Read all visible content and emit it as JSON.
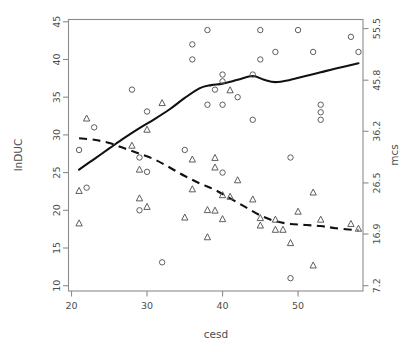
{
  "figure": {
    "width": 409,
    "height": 352,
    "background": "#ffffff",
    "foreground": "#4d4d4d"
  },
  "chart_data": {
    "type": "scatter",
    "title": "",
    "subtitle": "",
    "xlabel": "cesd",
    "ylabel": "lnDUC",
    "y2label": "mcs",
    "grid": false,
    "legend": "none",
    "xlim": [
      19.6,
      58.6
    ],
    "ylim": [
      9.3,
      45.3
    ],
    "y2lim": [
      6.2,
      57.2
    ],
    "xticks": [
      20,
      30,
      40,
      50
    ],
    "yticks": [
      10,
      15,
      20,
      25,
      30,
      35,
      40,
      45
    ],
    "y2ticks": [
      7.2,
      16.9,
      26.5,
      36.2,
      45.8,
      55.5
    ],
    "series": [
      {
        "name": "lnDUC",
        "marker": "circle",
        "axis": "left",
        "points": [
          [
            21,
            28.0
          ],
          [
            22,
            23.0
          ],
          [
            23,
            31.0
          ],
          [
            28,
            36.0
          ],
          [
            29,
            27.0
          ],
          [
            29,
            20.0
          ],
          [
            30,
            33.1
          ],
          [
            30,
            25.1
          ],
          [
            32,
            13.1
          ],
          [
            35,
            28.0
          ],
          [
            36,
            42.0
          ],
          [
            36,
            40.0
          ],
          [
            38,
            43.9
          ],
          [
            38,
            34.0
          ],
          [
            39,
            36.0
          ],
          [
            40,
            38.0
          ],
          [
            40,
            37.1
          ],
          [
            40,
            34.0
          ],
          [
            40,
            25.0
          ],
          [
            42,
            35.0
          ],
          [
            44,
            38.0
          ],
          [
            44,
            32.0
          ],
          [
            45,
            40.0
          ],
          [
            45,
            43.9
          ],
          [
            47,
            41.0
          ],
          [
            49,
            27.0
          ],
          [
            49,
            11.0
          ],
          [
            50,
            43.9
          ],
          [
            52,
            41.0
          ],
          [
            53,
            34.0
          ],
          [
            53,
            33.0
          ],
          [
            53,
            32.0
          ],
          [
            57,
            43.0
          ],
          [
            58,
            41.0
          ]
        ]
      },
      {
        "name": "mcs",
        "marker": "triangle",
        "axis": "right",
        "points": [
          [
            21,
            18.9
          ],
          [
            21,
            25.0
          ],
          [
            22,
            38.6
          ],
          [
            28,
            33.5
          ],
          [
            29,
            29.0
          ],
          [
            29,
            23.6
          ],
          [
            30,
            36.5
          ],
          [
            30,
            22.0
          ],
          [
            32,
            41.5
          ],
          [
            35,
            20.0
          ],
          [
            36,
            30.9
          ],
          [
            36,
            25.3
          ],
          [
            38,
            21.4
          ],
          [
            38,
            16.3
          ],
          [
            39,
            21.3
          ],
          [
            39,
            31.2
          ],
          [
            39,
            29.4
          ],
          [
            40,
            24.2
          ],
          [
            40,
            19.7
          ],
          [
            41,
            43.9
          ],
          [
            41,
            23.9
          ],
          [
            42,
            27.0
          ],
          [
            44,
            23.4
          ],
          [
            45,
            19.9
          ],
          [
            45,
            18.5
          ],
          [
            47,
            19.6
          ],
          [
            47,
            17.7
          ],
          [
            48,
            17.7
          ],
          [
            49,
            15.2
          ],
          [
            50,
            21.1
          ],
          [
            52,
            24.7
          ],
          [
            52,
            11.0
          ],
          [
            53,
            19.6
          ],
          [
            57,
            18.8
          ],
          [
            58,
            17.9
          ]
        ]
      }
    ],
    "smoothers": [
      {
        "name": "lnDUC-smoother",
        "linestyle": "solid",
        "axis": "left",
        "points": [
          [
            21.0,
            25.4
          ],
          [
            23.0,
            26.8
          ],
          [
            25.0,
            28.2
          ],
          [
            27.0,
            29.6
          ],
          [
            29.0,
            30.9
          ],
          [
            31.0,
            32.1
          ],
          [
            33.0,
            33.4
          ],
          [
            35.0,
            34.9
          ],
          [
            37.0,
            36.2
          ],
          [
            38.5,
            36.6
          ],
          [
            40.0,
            36.8
          ],
          [
            42.0,
            37.3
          ],
          [
            44.0,
            37.8
          ],
          [
            45.5,
            37.3
          ],
          [
            47.0,
            37.0
          ],
          [
            49.0,
            37.3
          ],
          [
            51.0,
            37.8
          ],
          [
            53.0,
            38.3
          ],
          [
            55.0,
            38.8
          ],
          [
            58.0,
            39.5
          ]
        ]
      },
      {
        "name": "mcs-smoother",
        "linestyle": "dashed",
        "axis": "right",
        "points": [
          [
            21.0,
            34.9
          ],
          [
            23.0,
            34.6
          ],
          [
            25.0,
            34.0
          ],
          [
            27.0,
            33.0
          ],
          [
            29.0,
            32.0
          ],
          [
            31.0,
            30.9
          ],
          [
            33.0,
            29.4
          ],
          [
            35.0,
            27.8
          ],
          [
            37.0,
            26.4
          ],
          [
            39.0,
            25.2
          ],
          [
            41.0,
            23.6
          ],
          [
            43.0,
            22.0
          ],
          [
            45.0,
            20.4
          ],
          [
            47.0,
            19.3
          ],
          [
            49.0,
            18.8
          ],
          [
            51.0,
            18.6
          ],
          [
            53.0,
            18.4
          ],
          [
            55.0,
            18.0
          ],
          [
            58.0,
            17.6
          ]
        ]
      }
    ]
  },
  "axes": {
    "x_title": "cesd",
    "y_left_title": "lnDUC",
    "y_right_title": "mcs",
    "x_tick_labels": [
      "20",
      "30",
      "40",
      "50"
    ],
    "y_left_tick_labels": [
      "10",
      "15",
      "20",
      "25",
      "30",
      "35",
      "40",
      "45"
    ],
    "y_right_tick_labels": [
      "7.2",
      "16.9",
      "26.5",
      "36.2",
      "45.8",
      "55.5"
    ]
  }
}
